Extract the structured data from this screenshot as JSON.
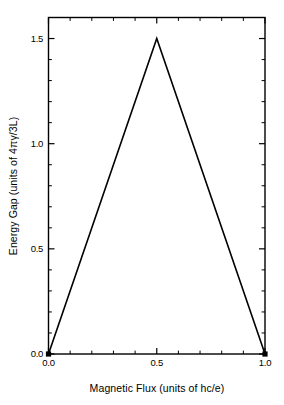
{
  "chart_data": {
    "type": "line",
    "title": "",
    "xlabel": "Magnetic Flux (units of hc/e)",
    "ylabel": "Energy Gap (units of 4πγ/3L)",
    "xlim": [
      0.0,
      1.0
    ],
    "ylim": [
      0.0,
      1.6
    ],
    "grid": false,
    "legend": null,
    "x_major_ticks": [
      0.0,
      0.5,
      1.0
    ],
    "x_major_tick_labels": [
      "0.0",
      "0.5",
      "1.0"
    ],
    "x_minor_ticks": [
      0.1,
      0.2,
      0.3,
      0.4,
      0.6,
      0.7,
      0.8,
      0.9
    ],
    "y_major_ticks": [
      0.0,
      0.5,
      1.0,
      1.5
    ],
    "y_major_tick_labels": [
      "0.0",
      "0.5",
      "1.0",
      "1.5"
    ],
    "y_minor_ticks": [
      0.1,
      0.2,
      0.3,
      0.4,
      0.6,
      0.7,
      0.8,
      0.9,
      1.1,
      1.2,
      1.3,
      1.4,
      1.6
    ],
    "series": [
      {
        "name": "energy gap",
        "x": [
          0.0,
          0.5,
          1.0
        ],
        "values": [
          0.0,
          1.5,
          0.0
        ],
        "color": "#000000",
        "marker": "square",
        "marker_points": [
          {
            "x": 0.0,
            "y": 0.0
          },
          {
            "x": 1.0,
            "y": 0.0
          }
        ]
      }
    ]
  },
  "figure": {
    "background_color": "#ffffff",
    "foreground_color": "#000000"
  }
}
